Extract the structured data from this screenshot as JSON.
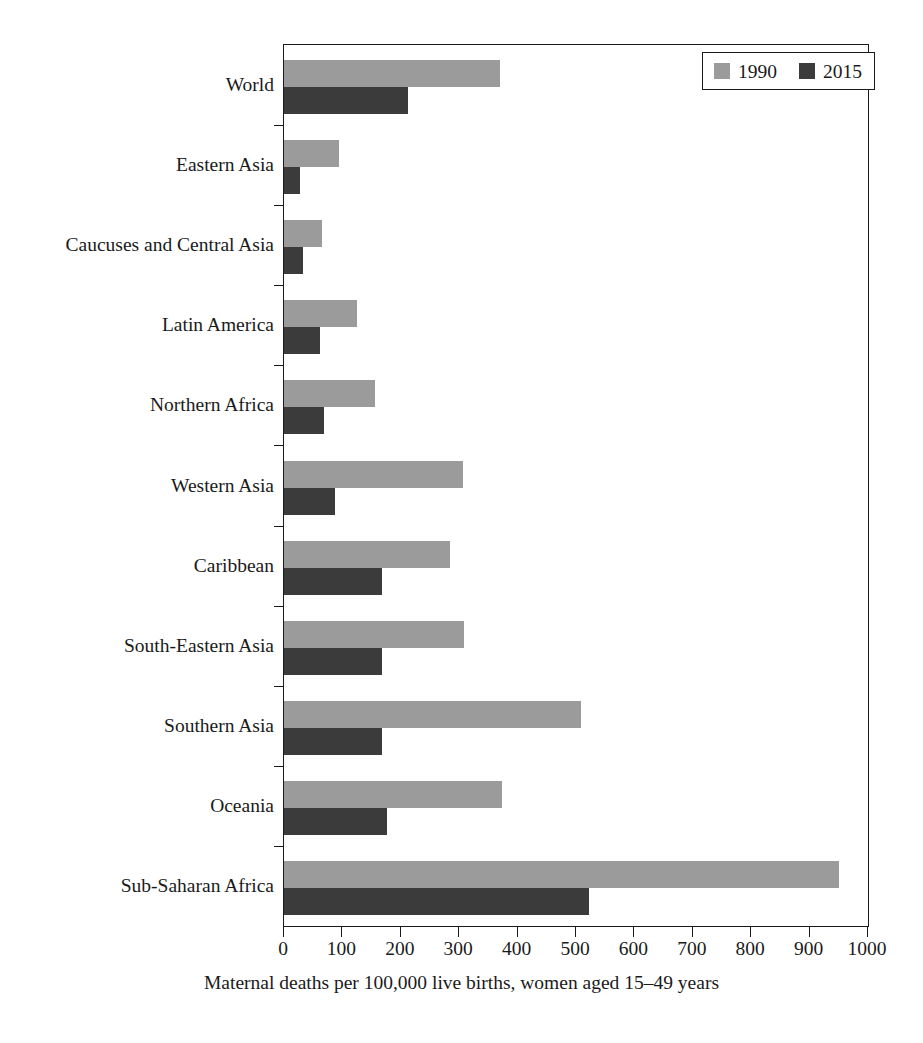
{
  "chart_data": {
    "type": "bar",
    "orientation": "horizontal",
    "title": "",
    "xlabel": "Maternal deaths per 100,000 live births, women aged 15–49 years",
    "ylabel": "",
    "xlim": [
      0,
      1000
    ],
    "xticks": [
      0,
      100,
      200,
      300,
      400,
      500,
      600,
      700,
      800,
      900,
      1000
    ],
    "xtick_labels": [
      "0",
      "100",
      "200",
      "300",
      "400",
      "500",
      "600",
      "700",
      "800",
      "900",
      "1000"
    ],
    "grid": false,
    "legend_position": "top-right",
    "categories": [
      "World",
      "Eastern Asia",
      "Caucuses and Central Asia",
      "Latin America",
      "Northern Africa",
      "Western Asia",
      "Caribbean",
      "South-Eastern Asia",
      "Southern Asia",
      "Oceania",
      "Sub-Saharan Africa"
    ],
    "series": [
      {
        "name": "1990",
        "color": "#9b9b9b",
        "values": [
          370,
          95,
          65,
          125,
          155,
          307,
          285,
          308,
          508,
          373,
          950
        ]
      },
      {
        "name": "2015",
        "color": "#3b3b3b",
        "values": [
          213,
          28,
          33,
          62,
          68,
          88,
          168,
          168,
          168,
          176,
          522
        ]
      }
    ]
  },
  "legend": {
    "entries": [
      {
        "label": "1990",
        "swatch_color": "#9b9b9b"
      },
      {
        "label": "2015",
        "swatch_color": "#3b3b3b"
      }
    ]
  },
  "axis": {
    "x_title": "Maternal deaths per 100,000 live births, women aged 15–49 years"
  }
}
